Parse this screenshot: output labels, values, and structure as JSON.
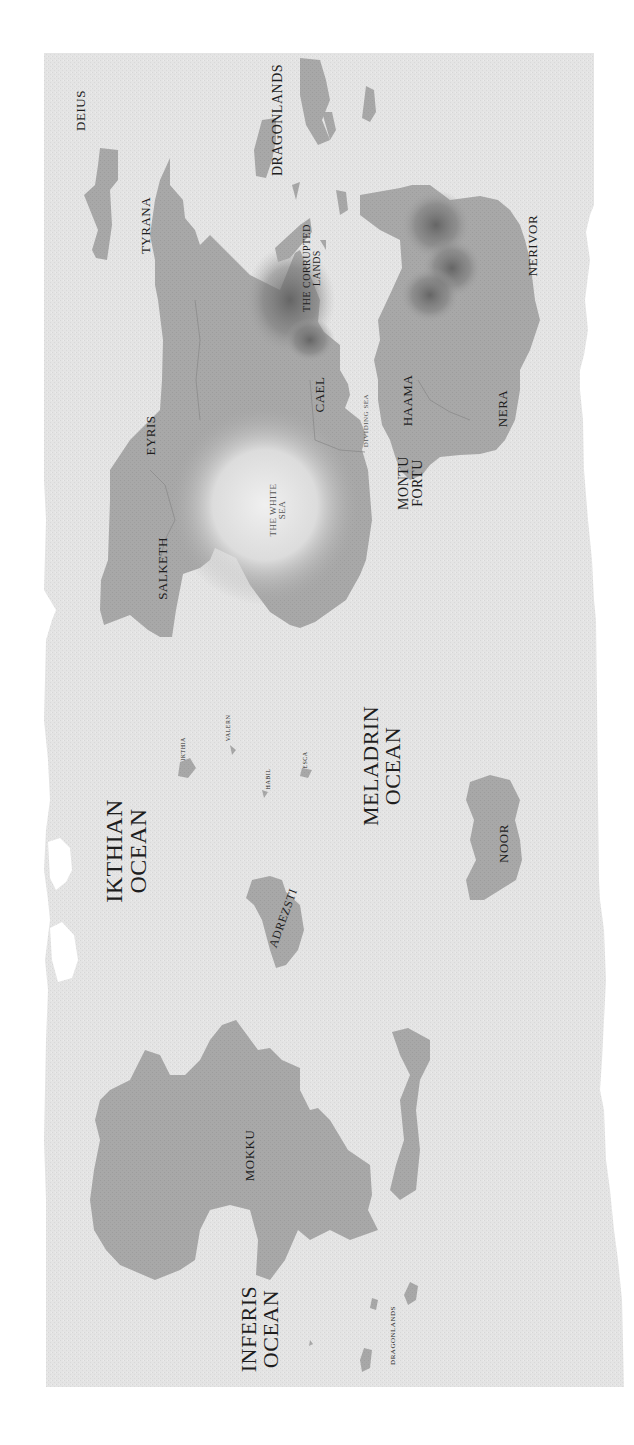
{
  "map": {
    "colors": {
      "page": "#ffffff",
      "parchment": "#e4e4e4",
      "land": "#a8a8a8",
      "highland": "#6e6e6e",
      "white_sea": "#ededed",
      "border_line": "#8a8a8a"
    },
    "labels": [
      {
        "id": "deius",
        "text": "DEIUS",
        "x": 80,
        "y": 110,
        "size": 13,
        "rot": -90
      },
      {
        "id": "tyrana",
        "text": "TYRANA",
        "x": 145,
        "y": 225,
        "size": 13,
        "rot": -90
      },
      {
        "id": "dragonlands-north",
        "text": "DRAGONLANDS",
        "x": 278,
        "y": 120,
        "size": 14,
        "rot": -90
      },
      {
        "id": "the-corrupted-lands",
        "text": "THE CORRUPTED\nLANDS",
        "x": 312,
        "y": 268,
        "size": 10,
        "rot": -90
      },
      {
        "id": "nerivor",
        "text": "NERIVOR",
        "x": 532,
        "y": 245,
        "size": 13,
        "rot": -90
      },
      {
        "id": "cael",
        "text": "CAEL",
        "x": 320,
        "y": 394,
        "size": 13,
        "rot": -90
      },
      {
        "id": "dividing-sea",
        "text": "DIVIDING SEA",
        "x": 366,
        "y": 420,
        "size": 7,
        "rot": -90,
        "faint": true
      },
      {
        "id": "haama",
        "text": "HAAMA",
        "x": 408,
        "y": 400,
        "size": 13,
        "rot": -90
      },
      {
        "id": "nera",
        "text": "NERA",
        "x": 502,
        "y": 408,
        "size": 13,
        "rot": -90
      },
      {
        "id": "eyris",
        "text": "EYRIS",
        "x": 150,
        "y": 435,
        "size": 13,
        "rot": -90
      },
      {
        "id": "the-white-sea",
        "text": "THE WHITE\nSEA",
        "x": 277,
        "y": 510,
        "size": 9,
        "rot": -90,
        "faint": true
      },
      {
        "id": "montu-fortu",
        "text": "MONTU\nFORTU",
        "x": 411,
        "y": 483,
        "size": 14,
        "rot": -90
      },
      {
        "id": "salketh",
        "text": "SALKETH",
        "x": 162,
        "y": 568,
        "size": 13,
        "rot": -90
      },
      {
        "id": "ikthia",
        "text": "IKTHIA",
        "x": 183,
        "y": 749,
        "size": 6,
        "rot": -90
      },
      {
        "id": "valern",
        "text": "VALERN",
        "x": 228,
        "y": 728,
        "size": 6,
        "rot": -90
      },
      {
        "id": "habil",
        "text": "HABIL",
        "x": 268,
        "y": 779,
        "size": 6,
        "rot": -90
      },
      {
        "id": "esca",
        "text": "ESCA",
        "x": 304,
        "y": 760,
        "size": 6,
        "rot": -90
      },
      {
        "id": "meladrin-ocean",
        "text": "MELADRIN\nOCEAN",
        "x": 382,
        "y": 766,
        "size": 22,
        "rot": -90
      },
      {
        "id": "ikthian-ocean",
        "text": "IKTHIAN\nOCEAN",
        "x": 125,
        "y": 851,
        "size": 24,
        "rot": -90
      },
      {
        "id": "noor",
        "text": "NOOR",
        "x": 503,
        "y": 843,
        "size": 13,
        "rot": -90
      },
      {
        "id": "adrezsti",
        "text": "ADREZSTI",
        "x": 283,
        "y": 918,
        "size": 12,
        "rot": -70
      },
      {
        "id": "mokku",
        "text": "MOKKU",
        "x": 250,
        "y": 1155,
        "size": 13,
        "rot": -90
      },
      {
        "id": "inferis-ocean",
        "text": "INFERIS\nOCEAN",
        "x": 260,
        "y": 1329,
        "size": 22,
        "rot": -90
      },
      {
        "id": "dragonlands-south",
        "text": "DRAGONLANDS",
        "x": 393,
        "y": 1335,
        "size": 7,
        "rot": -90
      }
    ]
  }
}
